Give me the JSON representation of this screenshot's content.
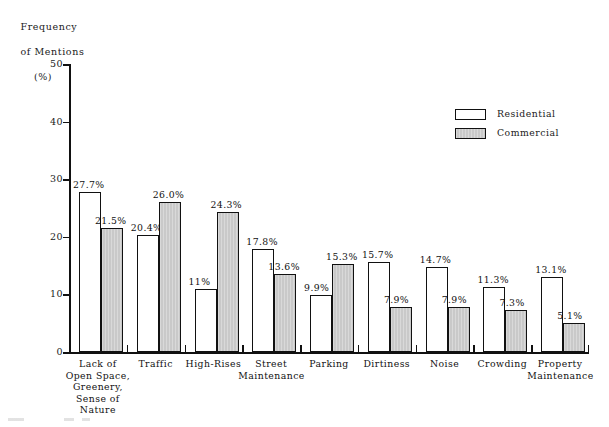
{
  "chart_data": {
    "type": "bar",
    "title": "",
    "xlabel": "",
    "ylabel": "Frequency of Mentions (%)",
    "ylabel_lines": [
      "Frequency",
      "of Mentions",
      "(%)"
    ],
    "ylim": [
      0,
      50
    ],
    "yticks": [
      0,
      10,
      20,
      30,
      40,
      50
    ],
    "ytick_labels": [
      "0",
      "10",
      "20",
      "30",
      "40",
      "50"
    ],
    "grid": false,
    "legend_position": "upper right",
    "categories": [
      "Lack of\nOpen Space,\nGreenery,\nSense of\nNature",
      "Traffic",
      "High-Rises",
      "Street\nMaintenance",
      "Parking",
      "Dirtiness",
      "Noise",
      "Crowding",
      "Property\nMaintenance"
    ],
    "series": [
      {
        "name": "Residential",
        "color": "#ffffff",
        "values": [
          27.7,
          20.4,
          11.0,
          17.8,
          9.9,
          15.7,
          14.7,
          11.3,
          13.1
        ],
        "labels": [
          "27.7%",
          "20.4%",
          "11%",
          "17.8%",
          "9.9%",
          "15.7%",
          "14.7%",
          "11.3%",
          "13.1%"
        ]
      },
      {
        "name": "Commercial",
        "color": "#c9c9c9",
        "values": [
          21.5,
          26.0,
          24.3,
          13.6,
          15.3,
          7.9,
          7.9,
          7.3,
          5.1
        ],
        "labels": [
          "21.5%",
          "26.0%",
          "24.3%",
          "13.6%",
          "15.3%",
          "7.9%",
          "7.9%",
          "7.3%",
          "5.1%"
        ]
      }
    ]
  },
  "legend": {
    "items": [
      {
        "label": "Residential",
        "swatch": "white"
      },
      {
        "label": "Commercial",
        "swatch": "gray"
      }
    ]
  },
  "colors": {
    "axis": "#111111",
    "residential_fill": "#ffffff",
    "commercial_fill": "#c9c9c9",
    "text": "#1a1a1a",
    "background": "#ffffff"
  }
}
